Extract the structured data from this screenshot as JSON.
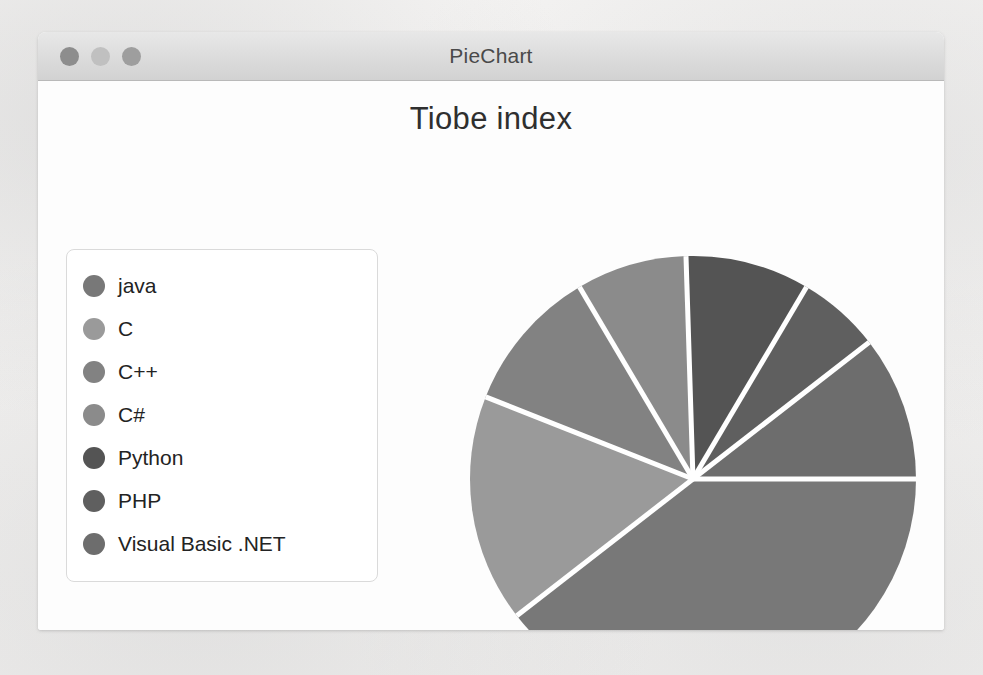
{
  "window": {
    "title": "PieChart",
    "traffic_lights": [
      {
        "name": "close",
        "color": "#8d8d8d"
      },
      {
        "name": "minimize",
        "color": "#c0c0c0"
      },
      {
        "name": "maximize",
        "color": "#9e9e9e"
      }
    ]
  },
  "chart_data": {
    "type": "pie",
    "title": "Tiobe index",
    "xlabel": "",
    "ylabel": "",
    "legend_position": "left",
    "grid": false,
    "start_angle_deg": 0,
    "direction": "clockwise",
    "center": {
      "x": 261,
      "y": 270
    },
    "radius": 223,
    "separator_color": "#ffffff",
    "separator_width": 5,
    "categories": [
      "java",
      "C",
      "C++",
      "C#",
      "Python",
      "PHP",
      "Visual Basic .NET"
    ],
    "values": [
      39.5,
      16.5,
      10.5,
      8.0,
      9.0,
      6.0,
      10.5
    ],
    "unit": "percent",
    "colors": [
      "#787878",
      "#9a9a9a",
      "#828282",
      "#8b8b8b",
      "#545454",
      "#5f5f5f",
      "#6d6d6d"
    ],
    "slices": [
      {
        "label": "java",
        "value": 39.5,
        "color": "#787878",
        "start_deg": 0,
        "end_deg": 142.2
      },
      {
        "label": "C",
        "value": 16.5,
        "color": "#9a9a9a",
        "start_deg": 142.2,
        "end_deg": 201.6
      },
      {
        "label": "C++",
        "value": 10.5,
        "color": "#828282",
        "start_deg": 201.6,
        "end_deg": 239.4
      },
      {
        "label": "C#",
        "value": 8.0,
        "color": "#8b8b8b",
        "start_deg": 239.4,
        "end_deg": 268.2
      },
      {
        "label": "Python",
        "value": 9.0,
        "color": "#545454",
        "start_deg": 268.2,
        "end_deg": 300.6
      },
      {
        "label": "PHP",
        "value": 6.0,
        "color": "#5f5f5f",
        "start_deg": 300.6,
        "end_deg": 322.2
      },
      {
        "label": "Visual Basic .NET",
        "value": 10.5,
        "color": "#6d6d6d",
        "start_deg": 322.2,
        "end_deg": 360.0
      }
    ]
  }
}
